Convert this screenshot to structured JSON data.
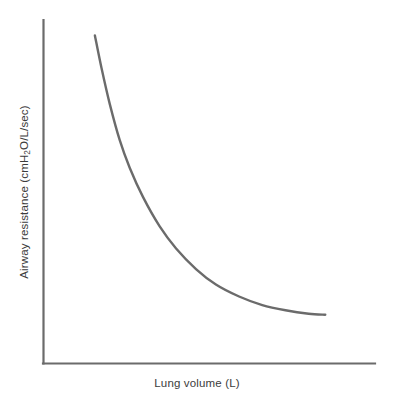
{
  "chart_data": {
    "type": "line",
    "title": "",
    "subtitle": "",
    "xlabel": "Lung volume (L)",
    "ylabel_full": "Airway resistance (cmH2O/L/sec)",
    "ylabel_prefix": "Airway resistance (cmH",
    "ylabel_subscript": "2",
    "ylabel_suffix": "O/L/sec)",
    "grid": false,
    "legend": false,
    "legend_position": "none",
    "axis_ticks": false,
    "tick_labels_x": [],
    "tick_labels_y": [],
    "xlim": [
      0,
      10
    ],
    "ylim": [
      0,
      10
    ],
    "series": [
      {
        "name": "Airway resistance",
        "description": "Inverse hyperbolic decay: resistance falls steeply as lung volume increases, then plateaus",
        "color": "#6b6b6b",
        "x": [
          1.55,
          1.75,
          2.0,
          2.3,
          2.6,
          3.0,
          3.5,
          4.0,
          4.6,
          5.2,
          5.9,
          6.6,
          7.3,
          8.0,
          8.5
        ],
        "y": [
          9.55,
          8.6,
          7.55,
          6.5,
          5.7,
          4.85,
          4.0,
          3.35,
          2.75,
          2.3,
          1.95,
          1.7,
          1.55,
          1.45,
          1.42
        ]
      }
    ],
    "annotations": []
  },
  "figure": {
    "background_color": "#ffffff",
    "line_color": "#6b6b6b",
    "axis_color": "#6b6b6b",
    "text_color": "#3c3c3c"
  }
}
